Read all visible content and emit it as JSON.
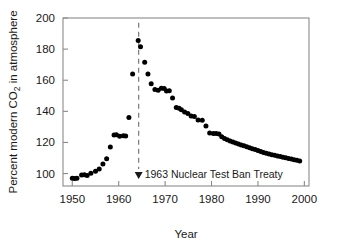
{
  "chart_data": {
    "type": "scatter",
    "title": "",
    "xlabel": "Year",
    "ylabel": "Percent modern CO2 in atmosphere",
    "ylabel_prefix": "Percent modern CO",
    "ylabel_subscript": "2",
    "ylabel_suffix": " in atmosphere",
    "xlim": [
      1948,
      2001
    ],
    "ylim": [
      92,
      200
    ],
    "xticks": [
      1950,
      1960,
      1970,
      1980,
      1990,
      2000
    ],
    "xtick_labels": [
      "1950",
      "1960",
      "1970",
      "1980",
      "1990",
      "2000"
    ],
    "yticks": [
      100,
      120,
      140,
      160,
      180,
      200
    ],
    "ytick_labels": [
      "100",
      "120",
      "140",
      "160",
      "180",
      "200"
    ],
    "grid": false,
    "legend": "none",
    "marker": "filled-circle",
    "marker_color": "#000000",
    "series": [
      {
        "name": "Percent modern CO2",
        "x": [
          1950.0,
          1950.5,
          1951.0,
          1952.0,
          1952.6,
          1953.2,
          1954.0,
          1955.0,
          1955.8,
          1956.6,
          1957.4,
          1958.2,
          1959.0,
          1959.5,
          1960.2,
          1961.0,
          1961.5,
          1962.2,
          1963.0,
          1964.2,
          1964.7,
          1965.6,
          1966.3,
          1967.0,
          1967.8,
          1968.5,
          1969.2,
          1969.8,
          1970.3,
          1970.9,
          1971.6,
          1972.4,
          1973.0,
          1973.5,
          1974.2,
          1974.9,
          1975.6,
          1976.3,
          1977.1,
          1978.0,
          1978.8,
          1979.6,
          1980.4,
          1981.0,
          1981.6,
          1982.2,
          1982.8,
          1983.4,
          1984.0,
          1984.6,
          1985.2,
          1985.8,
          1986.4,
          1987.0,
          1987.6,
          1988.2,
          1988.8,
          1989.4,
          1990.0,
          1990.6,
          1991.2,
          1991.8,
          1992.4,
          1993.0,
          1993.6,
          1994.2,
          1994.8,
          1995.4,
          1996.0,
          1996.6,
          1997.2,
          1997.8,
          1998.4,
          1999.0
        ],
        "y": [
          97.0,
          96.8,
          97.0,
          99.0,
          99.2,
          98.8,
          100.2,
          101.5,
          103.0,
          106.2,
          109.5,
          117.0,
          124.8,
          125.0,
          124.0,
          124.3,
          124.2,
          136.0,
          164.0,
          185.5,
          181.5,
          171.5,
          164.0,
          157.8,
          154.0,
          153.6,
          154.8,
          154.6,
          153.0,
          153.2,
          148.5,
          142.5,
          142.0,
          141.0,
          139.5,
          138.6,
          137.0,
          136.6,
          134.5,
          134.3,
          130.5,
          126.0,
          125.8,
          125.8,
          125.5,
          123.6,
          122.6,
          121.8,
          121.0,
          120.3,
          119.6,
          119.0,
          118.4,
          117.8,
          117.2,
          116.6,
          116.0,
          115.4,
          114.8,
          114.2,
          113.6,
          113.1,
          112.6,
          112.1,
          111.7,
          111.3,
          110.9,
          110.5,
          110.1,
          109.7,
          109.3,
          108.9,
          108.5,
          108.0
        ]
      }
    ],
    "annotations": [
      {
        "text": "1963 Nuclear Test Ban Treaty",
        "x": 1964.3,
        "marker": "down-triangle",
        "line_style": "dashed",
        "line_top_y": 197,
        "line_bottom_y": 93
      }
    ]
  }
}
